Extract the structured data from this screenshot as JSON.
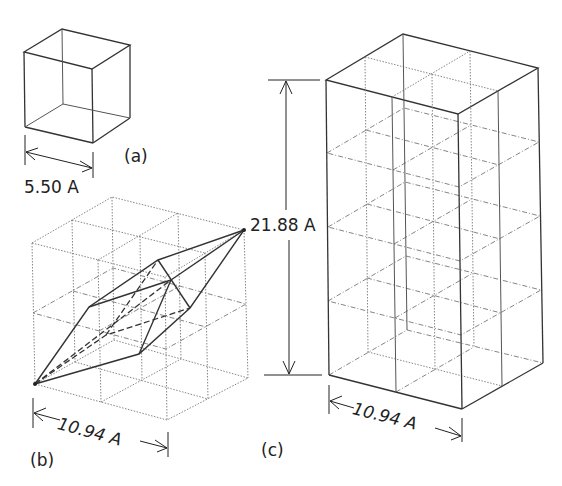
{
  "figure": {
    "panels": [
      {
        "id": "a",
        "label": "(a)",
        "description": "primitive cubic cell",
        "dimension": "5.50 A"
      },
      {
        "id": "b",
        "label": "(b)",
        "description": "2x2x2 cubes with rhombohedral cell",
        "dimension": "10.94 A"
      },
      {
        "id": "c",
        "label": "(c)",
        "description": "2x2x4 tetragonal supercell",
        "width_dimension": "10.94 A",
        "height_dimension": "21.88 A"
      }
    ]
  }
}
